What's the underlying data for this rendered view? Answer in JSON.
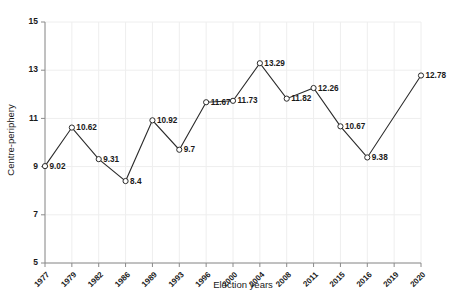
{
  "chart_data": {
    "type": "line",
    "title": "",
    "xlabel": "Election years",
    "ylabel": "Centre-periphery",
    "categories": [
      "1977",
      "1979",
      "1982",
      "1986",
      "1989",
      "1993",
      "1996",
      "2000",
      "2004",
      "2008",
      "2011",
      "2015",
      "2016",
      "2019",
      "2020"
    ],
    "values": [
      9.02,
      10.62,
      9.31,
      8.4,
      10.92,
      9.7,
      11.67,
      11.73,
      13.29,
      11.82,
      12.26,
      10.67,
      9.38,
      null,
      12.78
    ],
    "point_labels": [
      "9.02",
      "10.62",
      "9.31",
      "8.4",
      "10.92",
      "9.7",
      "11.67",
      "11.73",
      "13.29",
      "11.82",
      "12.26",
      "10.67",
      "9.38",
      "",
      "12.78"
    ],
    "ytick_labels": [
      "15",
      "13",
      "11",
      "9",
      "7",
      "5"
    ],
    "ytick_values": [
      15,
      13,
      11,
      9,
      7,
      5
    ],
    "ylim": [
      5,
      15
    ],
    "grid": true,
    "legend": "none",
    "marker": "open-circle",
    "line_color": "#2b2b2b",
    "grid_color": "#eeeeee",
    "axis_color": "#8a8a8a"
  }
}
